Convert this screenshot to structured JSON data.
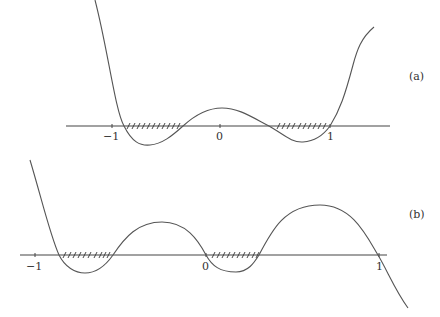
{
  "panels": [
    {
      "id": "a",
      "label": "(a)",
      "axis": {
        "y": 126,
        "x_start": 66,
        "x_end": 390
      },
      "ticks": [
        {
          "value": -1,
          "label": "−1",
          "x": 112
        },
        {
          "value": 0,
          "label": "0",
          "x": 220
        },
        {
          "value": 1,
          "label": "1",
          "x": 330
        }
      ],
      "hatched_intervals": [
        {
          "from_x": 124,
          "to_x": 183
        },
        {
          "from_x": 269,
          "to_x": 330
        }
      ],
      "roots_x": [
        124,
        183,
        269,
        330
      ]
    },
    {
      "id": "b",
      "label": "(b)",
      "axis": {
        "y": 255,
        "x_start": 20,
        "x_end": 387
      },
      "ticks": [
        {
          "value": -1,
          "label": "−1",
          "x": 35
        },
        {
          "value": 0,
          "label": "0",
          "x": 206
        },
        {
          "value": 1,
          "label": "1",
          "x": 379
        }
      ],
      "hatched_intervals": [
        {
          "from_x": 59,
          "to_x": 113
        },
        {
          "from_x": 206,
          "to_x": 259
        }
      ],
      "roots_x": [
        59,
        113,
        206,
        259,
        378
      ]
    }
  ]
}
